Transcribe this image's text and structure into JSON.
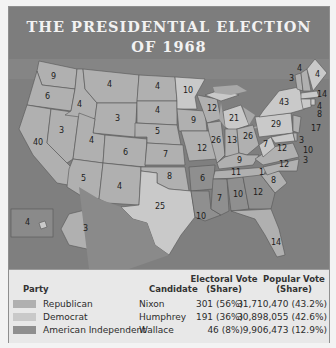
{
  "title": {
    "line1": "THE PRESIDENTIAL ELECTION",
    "line2": "OF 1968"
  },
  "colors": {
    "republican": "#b0b0b0",
    "democrat": "#c9c9c9",
    "american_independent": "#8f8f8f",
    "water": "#7f7f7f",
    "header": "#7d7d7d"
  },
  "map": {
    "states": [
      {
        "abbr": "WA",
        "ev": "9",
        "party": "republican"
      },
      {
        "abbr": "OR",
        "ev": "6",
        "party": "republican"
      },
      {
        "abbr": "CA",
        "ev": "40",
        "party": "republican"
      },
      {
        "abbr": "ID",
        "ev": "4",
        "party": "republican"
      },
      {
        "abbr": "NV",
        "ev": "3",
        "party": "republican"
      },
      {
        "abbr": "MT",
        "ev": "4",
        "party": "republican"
      },
      {
        "abbr": "WY",
        "ev": "3",
        "party": "republican"
      },
      {
        "abbr": "UT",
        "ev": "4",
        "party": "republican"
      },
      {
        "abbr": "AZ",
        "ev": "5",
        "party": "republican"
      },
      {
        "abbr": "CO",
        "ev": "6",
        "party": "republican"
      },
      {
        "abbr": "NM",
        "ev": "4",
        "party": "republican"
      },
      {
        "abbr": "ND",
        "ev": "4",
        "party": "republican"
      },
      {
        "abbr": "SD",
        "ev": "4",
        "party": "republican"
      },
      {
        "abbr": "NE",
        "ev": "5",
        "party": "republican"
      },
      {
        "abbr": "KS",
        "ev": "7",
        "party": "republican"
      },
      {
        "abbr": "OK",
        "ev": "8",
        "party": "republican"
      },
      {
        "abbr": "TX",
        "ev": "25",
        "party": "democrat"
      },
      {
        "abbr": "MN",
        "ev": "10",
        "party": "democrat"
      },
      {
        "abbr": "IA",
        "ev": "9",
        "party": "republican"
      },
      {
        "abbr": "MO",
        "ev": "12",
        "party": "republican"
      },
      {
        "abbr": "AR",
        "ev": "6",
        "party": "american_independent"
      },
      {
        "abbr": "LA",
        "ev": "10",
        "party": "american_independent"
      },
      {
        "abbr": "WI",
        "ev": "12",
        "party": "republican"
      },
      {
        "abbr": "IL",
        "ev": "26",
        "party": "republican"
      },
      {
        "abbr": "MI",
        "ev": "21",
        "party": "democrat"
      },
      {
        "abbr": "IN",
        "ev": "13",
        "party": "republican"
      },
      {
        "abbr": "OH",
        "ev": "26",
        "party": "republican"
      },
      {
        "abbr": "KY",
        "ev": "9",
        "party": "republican"
      },
      {
        "abbr": "TN",
        "ev": "11",
        "party": "republican"
      },
      {
        "abbr": "MS",
        "ev": "7",
        "party": "american_independent"
      },
      {
        "abbr": "AL",
        "ev": "10",
        "party": "american_independent"
      },
      {
        "abbr": "GA",
        "ev": "12",
        "party": "american_independent"
      },
      {
        "abbr": "FL",
        "ev": "14",
        "party": "republican"
      },
      {
        "abbr": "SC",
        "ev": "8",
        "party": "republican"
      },
      {
        "abbr": "NC",
        "ev": "12",
        "party": "republican"
      },
      {
        "abbr": "NC-Wallace",
        "ev": "1",
        "party": "american_independent"
      },
      {
        "abbr": "VA",
        "ev": "12",
        "party": "republican"
      },
      {
        "abbr": "WV",
        "ev": "7",
        "party": "democrat"
      },
      {
        "abbr": "PA",
        "ev": "29",
        "party": "democrat"
      },
      {
        "abbr": "NY",
        "ev": "43",
        "party": "democrat"
      },
      {
        "abbr": "VT",
        "ev": "3",
        "party": "republican"
      },
      {
        "abbr": "NH",
        "ev": "4",
        "party": "republican"
      },
      {
        "abbr": "ME",
        "ev": "4",
        "party": "democrat"
      },
      {
        "abbr": "MA",
        "ev": "14",
        "party": "democrat"
      },
      {
        "abbr": "RI",
        "ev": "4",
        "party": "democrat"
      },
      {
        "abbr": "CT",
        "ev": "8",
        "party": "democrat"
      },
      {
        "abbr": "NJ",
        "ev": "17",
        "party": "republican"
      },
      {
        "abbr": "DE",
        "ev": "3",
        "party": "republican"
      },
      {
        "abbr": "MD",
        "ev": "10",
        "party": "democrat"
      },
      {
        "abbr": "DC",
        "ev": "3",
        "party": "democrat"
      },
      {
        "abbr": "AK",
        "ev": "3",
        "party": "republican"
      },
      {
        "abbr": "HI",
        "ev": "4",
        "party": "democrat"
      }
    ]
  },
  "legend": {
    "headers": {
      "party": "Party",
      "candidate": "Candidate",
      "electoral": "Electoral Vote\n(Share)",
      "electoral_l1": "Electoral Vote",
      "electoral_l2": "(Share)",
      "popular_l1": "Popular Vote",
      "popular_l2": "(Share)"
    },
    "rows": [
      {
        "party": "Republican",
        "candidate": "Nixon",
        "electoral": "301 (56%)",
        "popular": "31,710,470 (43.2%)"
      },
      {
        "party": "Democrat",
        "candidate": "Humphrey",
        "electoral": "191 (36%)",
        "popular": "30,898,055 (42.6%)"
      },
      {
        "party": "American Independent",
        "candidate": "Wallace",
        "electoral": "46 (8%)",
        "popular": "9,906,473 (12.9%)"
      }
    ]
  }
}
